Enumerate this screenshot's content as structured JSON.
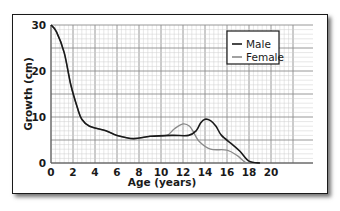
{
  "chart_data": {
    "type": "line",
    "title": "",
    "xlabel": "Age (years)",
    "ylabel": "Growth (cm)",
    "xlim": [
      0,
      22
    ],
    "ylim": [
      0,
      30
    ],
    "x_ticks": [
      0,
      2,
      4,
      6,
      8,
      10,
      12,
      14,
      16,
      18,
      20
    ],
    "y_ticks": [
      0,
      10,
      20,
      30
    ],
    "grid": true,
    "legend_position": "upper right",
    "series": [
      {
        "name": "Male",
        "color": "#1a1a1a",
        "x": [
          0,
          0.5,
          1.2,
          1.8,
          2.4,
          2.8,
          3.5,
          5,
          6,
          7.5,
          9,
          11,
          12.5,
          13.2,
          13.6,
          14,
          14.5,
          15,
          15.5,
          16.5,
          17.2,
          18,
          19
        ],
        "y": [
          30,
          28.5,
          24,
          17,
          12,
          9.5,
          8,
          7,
          6,
          5.3,
          5.8,
          6,
          6,
          7,
          8.7,
          9.5,
          9.2,
          8,
          6,
          4,
          2.5,
          0.4,
          0
        ]
      },
      {
        "name": "Female",
        "color": "#8a8a8a",
        "x": [
          0,
          0.5,
          1.2,
          1.8,
          2.4,
          2.8,
          3.5,
          5,
          6,
          7.5,
          9,
          10.5,
          11.2,
          12,
          12.6,
          13,
          13.5,
          14.5,
          16,
          17,
          17.8,
          19
        ],
        "y": [
          30,
          28.5,
          24,
          17,
          12,
          9.5,
          8,
          7,
          6,
          5.3,
          5.8,
          6,
          7.4,
          8.5,
          8,
          6.5,
          4.6,
          3,
          2.8,
          1.5,
          0,
          0
        ]
      }
    ]
  },
  "labels": {
    "xlabel": "Age (years)",
    "ylabel": "Growth (cm)",
    "legend": [
      "Male",
      "Female"
    ],
    "y_ticks": [
      "30",
      "20",
      "10",
      "0"
    ],
    "x_ticks": [
      "0",
      "2",
      "4",
      "6",
      "8",
      "10",
      "12",
      "14",
      "16",
      "18",
      "20"
    ]
  }
}
